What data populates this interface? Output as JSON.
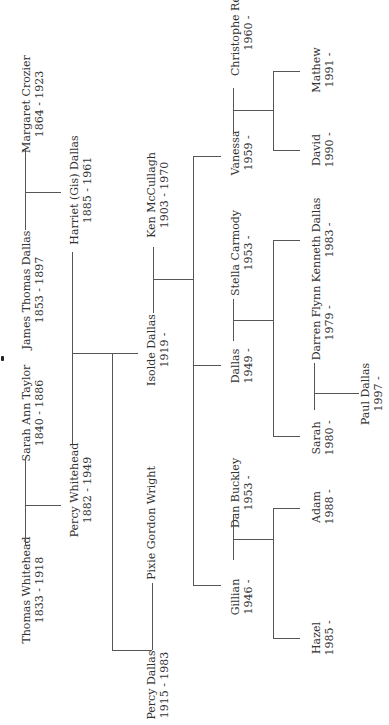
{
  "people": {
    "thomas_whitehead": {
      "name": "Thomas Whitehead",
      "dates": "1833 - 1918"
    },
    "sarah_ann_taylor": {
      "name": "Sarah Ann Taylor",
      "dates": "1840 - 1886"
    },
    "james_thomas_dallas": {
      "name": "James Thomas Dallas",
      "dates": "1853 - 1897"
    },
    "margaret_crozier": {
      "name": "Margaret Crozier",
      "dates": "1864 - 1923"
    },
    "percy_whitehead": {
      "name": "Percy Whitehead",
      "dates": "1882 - 1949"
    },
    "harriet_dallas": {
      "name": "Harriet (Gis) Dallas",
      "dates": "1885 - 1961"
    },
    "percy_dallas": {
      "name": "Percy Dallas",
      "dates": "1915 - 1983"
    },
    "pixie_gordon_wright": {
      "name": "Pixie Gordon Wright",
      "dates": ""
    },
    "isolde_dallas": {
      "name": "Isolde Dallas",
      "dates": "1919 -"
    },
    "ken_mccullagh": {
      "name": "Ken McCullagh",
      "dates": "1903 - 1970"
    },
    "gillian": {
      "name": "Gillian",
      "dates": "1946 -"
    },
    "dan_buckley": {
      "name": "Dan Buckley",
      "dates": "1953 -"
    },
    "dallas": {
      "name": "Dallas",
      "dates": "1949 -"
    },
    "stella_carmody": {
      "name": "Stella Carmody",
      "dates": "1953 -"
    },
    "vanessa": {
      "name": "Vanessa",
      "dates": "1959 -"
    },
    "christophe_rey": {
      "name": "Christophe Rey",
      "dates": "1960 -"
    },
    "hazel": {
      "name": "Hazel",
      "dates": "1985 -"
    },
    "adam": {
      "name": "Adam",
      "dates": "1988 -"
    },
    "sarah": {
      "name": "Sarah",
      "dates": "1980 -"
    },
    "darren_flynn": {
      "name": "Darren Flynn",
      "dates": "1979 -"
    },
    "kenneth_dallas": {
      "name": "Kenneth Dallas",
      "dates": "1983 -"
    },
    "david": {
      "name": "David",
      "dates": "1990 -"
    },
    "mathew": {
      "name": "Mathew",
      "dates": "1991 -"
    },
    "paul_dallas": {
      "name": "Paul Dallas",
      "dates": "1997 -"
    }
  },
  "colors": {
    "line": "#555555",
    "text": "#333333",
    "background": "#ffffff"
  }
}
